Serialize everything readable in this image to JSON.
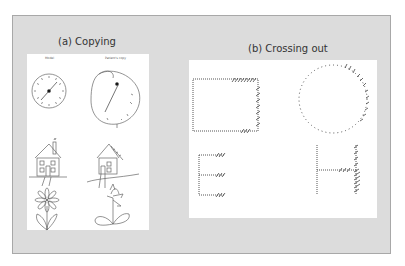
{
  "figure": {
    "panel_a": {
      "title": "(a) Copying",
      "columns": [
        "Model",
        "Patient's copy"
      ],
      "items": [
        "clock",
        "house",
        "flower"
      ]
    },
    "panel_b": {
      "title": "(b) Crossing out",
      "items": [
        "rectangle",
        "circle",
        "letter E",
        "letter H"
      ]
    },
    "colors": {
      "background": "#dcdcdc",
      "card": "#ffffff",
      "border": "#a8a8a8",
      "ink": "#555555"
    }
  }
}
